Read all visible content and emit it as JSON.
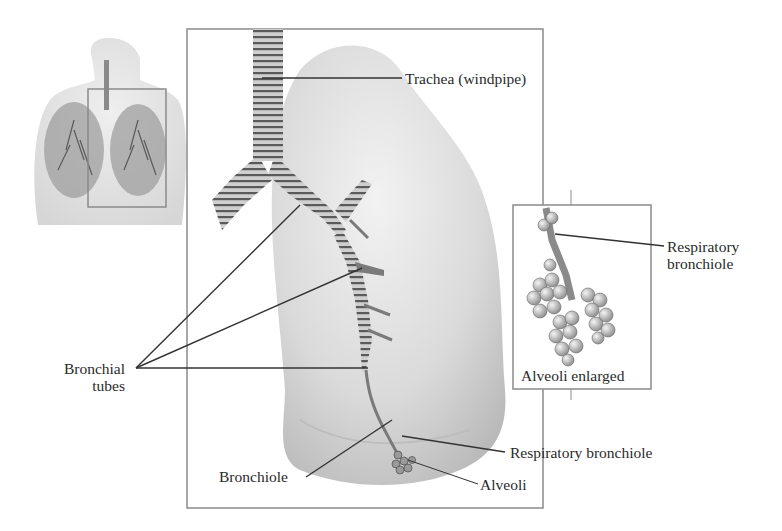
{
  "figure": {
    "panels": {
      "torso_inset": {
        "description": "Torso with lungs, right lung highlighted by box"
      },
      "main_lung": {
        "description": "Enlarged lung with trachea and bronchial tree"
      },
      "alveoli_inset": {
        "caption": "Alveoli enlarged"
      }
    },
    "labels": {
      "trachea": "Trachea (windpipe)",
      "bronchial_tubes_line1": "Bronchial",
      "bronchial_tubes_line2": "tubes",
      "bronchiole": "Bronchiole",
      "respiratory_bronchiole_main": "Respiratory bronchiole",
      "alveoli": "Alveoli",
      "respiratory_bronchiole_inset_line1": "Respiratory",
      "respiratory_bronchiole_inset_line2": "bronchiole",
      "alveoli_enlarged": "Alveoli enlarged"
    },
    "colors": {
      "frame": "#8a8a8a",
      "leader_line": "#333333",
      "lung_fill": "#d9d9d9",
      "airway": "#7a7a7a",
      "text": "#2a2a2a"
    }
  }
}
